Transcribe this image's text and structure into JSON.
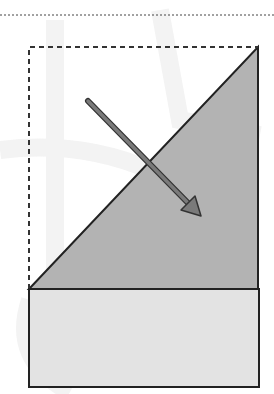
{
  "diagram": {
    "colors": {
      "background": "#ffffff",
      "watermark": "#f0f0f0",
      "dashed_line": "#333333",
      "triangle_fill": "#b3b3b3",
      "base_fill": "#e3e3e3",
      "outline": "#222222",
      "arrow_fill": "#7a7a7a",
      "arrow_stroke": "#333333"
    },
    "top_dotted_line": {
      "x1": 0,
      "y1": 15,
      "x2": 274,
      "y2": 15,
      "style": "dotted"
    },
    "dashed_outline": {
      "x": 29,
      "y": 47,
      "width": 229,
      "height": 242,
      "style": "dashed",
      "open_side": "right"
    },
    "triangle_flap": {
      "points": [
        [
          29,
          289
        ],
        [
          258,
          47
        ],
        [
          258,
          289
        ]
      ]
    },
    "base_rectangle": {
      "x": 29,
      "y": 289,
      "width": 230,
      "height": 98
    },
    "fold_arrow": {
      "from": [
        88,
        100
      ],
      "to": [
        200,
        215
      ],
      "direction": "down-right"
    }
  }
}
